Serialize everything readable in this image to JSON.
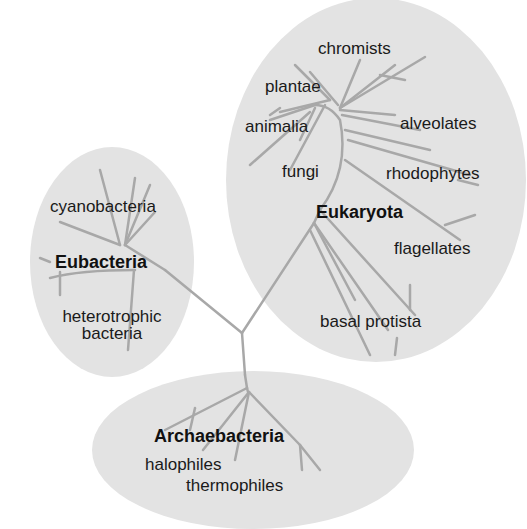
{
  "diagram": {
    "type": "phylogenetic-tree",
    "colors": {
      "ellipse_fill": "#e3e3e3",
      "branch": "#a8a8a8",
      "text": "#1a1a1a",
      "background": "#ffffff"
    },
    "domains": [
      {
        "name": "Eukaryota",
        "groups": [
          "chromists",
          "plantae",
          "animalia",
          "alveolates",
          "fungi",
          "rhodophytes",
          "flagellates",
          "basal protista"
        ]
      },
      {
        "name": "Eubacteria",
        "groups": [
          "cyanobacteria",
          "heterotrophic bacteria"
        ]
      },
      {
        "name": "Archaebacteria",
        "groups": [
          "halophiles",
          "thermophiles"
        ]
      }
    ]
  },
  "labels": {
    "eukaryota": "Eukaryota",
    "eubacteria": "Eubacteria",
    "archaebacteria": "Archaebacteria",
    "chromists": "chromists",
    "plantae": "plantae",
    "animalia": "animalia",
    "alveolates": "alveolates",
    "fungi": "fungi",
    "rhodophytes": "rhodophytes",
    "flagellates": "flagellates",
    "basal_protista": "basal protista",
    "cyanobacteria": "cyanobacteria",
    "heterotrophic_1": "heterotrophic",
    "heterotrophic_2": "bacteria",
    "halophiles": "halophiles",
    "thermophiles": "thermophiles"
  }
}
